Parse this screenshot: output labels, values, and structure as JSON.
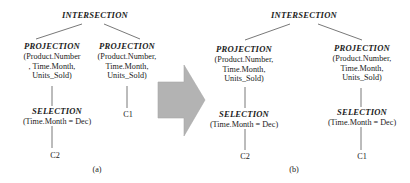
{
  "figure_a": {
    "root": "INTERSECTION",
    "left": {
      "op": "PROJECTION",
      "args": [
        "(Product.Number",
        ", Time.Month,",
        "Units_Sold)"
      ],
      "child": {
        "op": "SELECTION",
        "args": "(Time.Month = Dec)",
        "leaf": "C2"
      }
    },
    "right": {
      "op": "PROJECTION",
      "args": [
        "(Product.Number,",
        "Time.Month,",
        "Units_Sold)"
      ],
      "leaf": "C1"
    },
    "caption": "(a)"
  },
  "arrow": {
    "color": "#b3b3b3",
    "direction": "right"
  },
  "figure_b": {
    "root": "INTERSECTION",
    "left": {
      "op": "PROJECTION",
      "args": [
        "(Product.Number,",
        "Time.Month,",
        "Units_Sold)"
      ],
      "child": {
        "op": "SELECTION",
        "args": "(Time.Month = Dec)",
        "leaf": "C2"
      }
    },
    "right": {
      "op": "PROJECTION",
      "args": [
        "(Product.Number,",
        "Time.Month,",
        "Units_Sold)"
      ],
      "child": {
        "op": "SELECTION",
        "args": "(Time.Month = Dec)",
        "leaf": "C1"
      }
    },
    "caption": "(b)"
  }
}
